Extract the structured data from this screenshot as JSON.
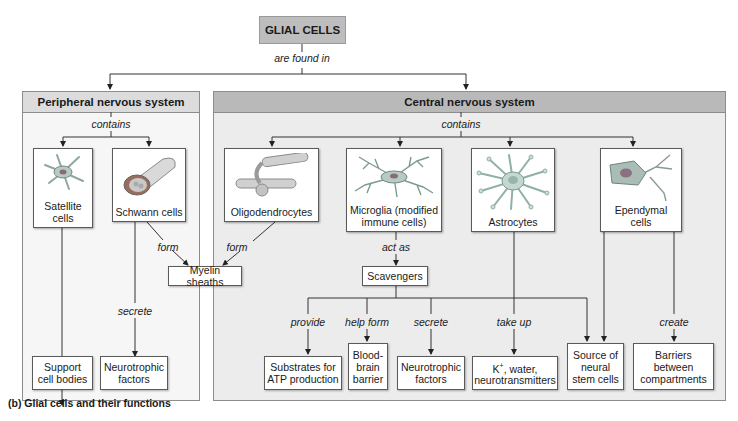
{
  "title": "GLIAL CELLS",
  "root_relation": "are found in",
  "caption": "(b) Glial cells and their functions",
  "colors": {
    "title_fill": "#bdbdbd",
    "pns_header": "#dcdcdc",
    "pns_body": "#f6f6f6",
    "cns_header": "#b9b9b9",
    "cns_body": "#ececec",
    "line": "#333333"
  },
  "pns": {
    "heading": "Peripheral nervous system",
    "relation": "contains",
    "cells": [
      {
        "name": "Satellite cells",
        "line1": "Satellite",
        "line2": "cells",
        "icon": "satellite-cell-icon"
      },
      {
        "name": "Schwann cells",
        "line1": "Schwann cells",
        "line2": "",
        "icon": "schwann-cell-icon"
      }
    ]
  },
  "cns": {
    "heading": "Central nervous system",
    "relation": "contains",
    "cells": [
      {
        "name": "Oligodendrocytes",
        "line1": "Oligodendrocytes",
        "line2": "",
        "icon": "oligodendrocyte-icon"
      },
      {
        "name": "Microglia (modified immune cells)",
        "line1": "Microglia (modified",
        "line2": "immune cells)",
        "icon": "microglia-icon"
      },
      {
        "name": "Astrocytes",
        "line1": "Astrocytes",
        "line2": "",
        "icon": "astrocyte-icon"
      },
      {
        "name": "Ependymal cells",
        "line1": "Ependymal",
        "line2": "cells",
        "icon": "ependymal-cell-icon"
      }
    ]
  },
  "relations": {
    "schwann_form": "form",
    "oligo_form": "form",
    "microglia_act_as": "act as",
    "schwann_secrete": "secrete",
    "provide": "provide",
    "help_form": "help form",
    "astro_secrete": "secrete",
    "take_up": "take up",
    "create": "create"
  },
  "intermediate": {
    "myelin": "Myelin sheaths",
    "scavengers": "Scavengers"
  },
  "functions": {
    "support": {
      "line1": "Support",
      "line2": "cell bodies"
    },
    "pns_neurotrophic": {
      "line1": "Neurotrophic",
      "line2": "factors"
    },
    "substrates": {
      "line1": "Substrates for",
      "line2": "ATP production"
    },
    "bbb": {
      "line1": "Blood-",
      "line2": "brain",
      "line3": "barrier"
    },
    "cns_neurotrophic": {
      "line1": "Neurotrophic",
      "line2": "factors"
    },
    "k_water": {
      "line1_prefix": "K",
      "line1_sup": "+",
      "line1_suffix": ", water,",
      "line2": "neurotransmitters"
    },
    "stem": {
      "line1": "Source of",
      "line2": "neural",
      "line3": "stem cells"
    },
    "barriers": {
      "line1": "Barriers",
      "line2": "between",
      "line3": "compartments"
    }
  }
}
